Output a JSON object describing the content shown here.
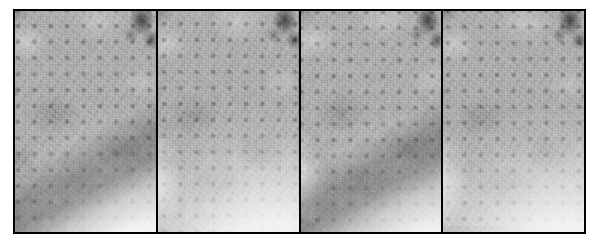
{
  "figure": {
    "kind": "grayscale-micrograph-panel-series",
    "panel_count": 4,
    "border_color": "#000000",
    "background_color": "#ffffff",
    "caption": "",
    "panels": [
      {
        "index": 1,
        "label": "",
        "description": "Grayscale micrograph with periodic square dot lattice; darker upper field, bright lower-right region, dark blob cluster at upper right, dark diagonal streak at lower left.",
        "mean_tone": "#9d9d9d",
        "bright_region": "lower-right",
        "dark_feature": "upper-right blob"
      },
      {
        "index": 2,
        "label": "",
        "description": "Grayscale micrograph with periodic square dot lattice; darker upper field, bright lower-right region, dark blob cluster at upper right.",
        "mean_tone": "#9c9c9c",
        "bright_region": "lower-right",
        "dark_feature": "upper-right blob"
      },
      {
        "index": 3,
        "label": "",
        "description": "Grayscale micrograph with periodic square dot lattice; darker upper field, bright lower-right region, dark blob cluster at upper right, bright left edge sliver.",
        "mean_tone": "#9e9e9e",
        "bright_region": "lower-right",
        "dark_feature": "upper-right blob"
      },
      {
        "index": 4,
        "label": "",
        "description": "Grayscale micrograph with periodic square dot lattice; darker upper field, bright lower-right region, dark blob cluster at upper right.",
        "mean_tone": "#9d9d9d",
        "bright_region": "lower-right",
        "dark_feature": "upper-right blob"
      }
    ]
  }
}
